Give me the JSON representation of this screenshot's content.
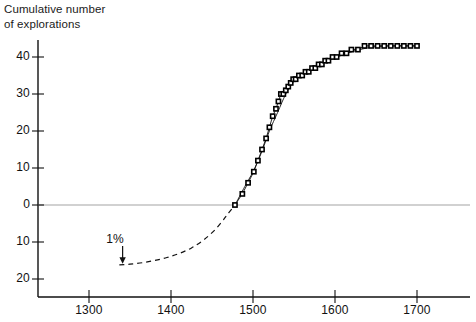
{
  "chart_data": {
    "type": "line",
    "title": "Cumulative number\nof explorations",
    "xlabel": "",
    "ylabel": "",
    "xlim": [
      1255,
      1720
    ],
    "ylim": [
      -22,
      46
    ],
    "grid": false,
    "legend": null,
    "x_ticks": [
      1300,
      1400,
      1500,
      1600,
      1700
    ],
    "x_tick_labels": [
      "1300",
      "1400",
      "1500",
      "1600",
      "1700"
    ],
    "y_ticks": [
      40,
      30,
      20,
      10,
      0,
      -10,
      -20
    ],
    "y_tick_labels": [
      "40",
      "30",
      "20",
      "10",
      "0",
      "10",
      "20"
    ],
    "zero_line": 0,
    "annotations": [
      {
        "text": "1%",
        "x": 1337,
        "y": -10,
        "arrow_to_x": 1341,
        "arrow_to_y": -16
      }
    ],
    "series": [
      {
        "name": "observed explorations",
        "style": "solid-with-square-markers",
        "marker": "square",
        "x": [
          1478,
          1487,
          1494,
          1501,
          1506,
          1511,
          1516,
          1520,
          1524,
          1528,
          1531,
          1534,
          1537,
          1540,
          1543,
          1546,
          1549,
          1552,
          1556,
          1560,
          1564,
          1568,
          1572,
          1576,
          1580,
          1584,
          1588,
          1592,
          1597,
          1602,
          1608,
          1614,
          1620,
          1628,
          1636,
          1644,
          1652,
          1660,
          1668,
          1676,
          1684,
          1692,
          1700
        ],
        "y": [
          0,
          3,
          6,
          9,
          12,
          15,
          18,
          21,
          24,
          26,
          28,
          30,
          30,
          31,
          32,
          33,
          34,
          34,
          35,
          35,
          36,
          36,
          37,
          37,
          38,
          38,
          39,
          39,
          40,
          40,
          41,
          41,
          42,
          42,
          43,
          43,
          43,
          43,
          43,
          43,
          43,
          43,
          43
        ]
      },
      {
        "name": "fitted logistic curve",
        "style": "solid-thin",
        "marker": "none",
        "x": [
          1478,
          1490,
          1500,
          1510,
          1520,
          1530,
          1540,
          1550,
          1560,
          1570,
          1580,
          1590,
          1600,
          1615,
          1630,
          1650,
          1670,
          1700
        ],
        "y": [
          0,
          5,
          9,
          14,
          20,
          25,
          30,
          33.5,
          35.5,
          36.8,
          38,
          39,
          39.8,
          41,
          42,
          42.8,
          43,
          43
        ]
      },
      {
        "name": "extrapolated tail",
        "style": "dashed",
        "marker": "none",
        "x": [
          1337,
          1350,
          1365,
          1380,
          1395,
          1410,
          1425,
          1440,
          1455,
          1468,
          1478
        ],
        "y": [
          -16.2,
          -16,
          -15.6,
          -15,
          -14.2,
          -13.1,
          -11.6,
          -9.4,
          -6.4,
          -2.8,
          0
        ]
      }
    ]
  }
}
